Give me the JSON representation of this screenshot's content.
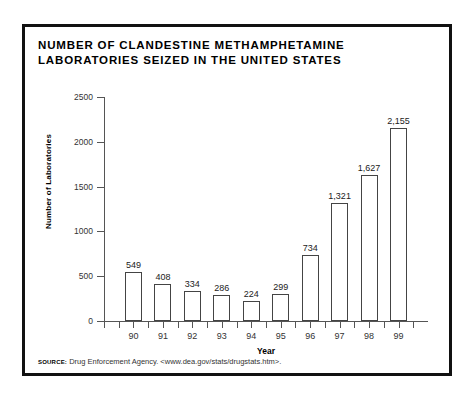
{
  "title": "NUMBER OF CLANDESTINE METHAMPHETAMINE LABORATORIES SEIZED IN THE UNITED STATES",
  "source": {
    "label": "SOURCE:",
    "text": "Drug Enforcement Agency. <www.dea.gov/stats/drugstats.htm>."
  },
  "chart_data": {
    "type": "bar",
    "title": "NUMBER OF CLANDESTINE METHAMPHETAMINE LABORATORIES SEIZED IN THE UNITED STATES",
    "xlabel": "Year",
    "ylabel": "Number of Laboratories",
    "categories": [
      "90",
      "91",
      "92",
      "93",
      "94",
      "95",
      "96",
      "97",
      "98",
      "99"
    ],
    "values": [
      549,
      408,
      334,
      286,
      224,
      299,
      734,
      1321,
      1627,
      2155
    ],
    "value_labels": [
      "549",
      "408",
      "334",
      "286",
      "224",
      "299",
      "734",
      "1,321",
      "1,627",
      "2,155"
    ],
    "ylim": [
      0,
      2500
    ],
    "yticks": [
      0,
      500,
      1000,
      1500,
      2000,
      2500
    ],
    "ytick_labels": [
      "0",
      "500",
      "1000",
      "1500",
      "2000",
      "2500"
    ],
    "grid": false,
    "legend": false,
    "bar_fill": "#ffffff",
    "bar_edge": "#444444",
    "axis_color": "#555555",
    "frame_color": "#111111",
    "background": "#ffffff"
  }
}
